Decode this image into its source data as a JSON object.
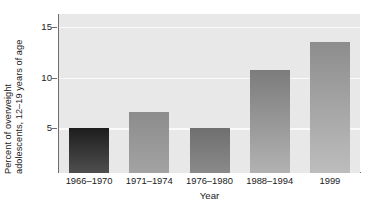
{
  "chart_data": {
    "type": "bar",
    "title": "",
    "subtitle": "",
    "xlabel": "Year",
    "ylabel_line1": "Percent of overweight",
    "ylabel_line2": "adolescents, 12–19 years of age",
    "ylabel": "Percent of overweight adolescents, 12–19 years of age",
    "categories": [
      "1966–1970",
      "1971–1974",
      "1976–1980",
      "1988–1994",
      "1999"
    ],
    "values": [
      5.0,
      6.6,
      5.0,
      10.8,
      13.5
    ],
    "ylim": [
      0.6,
      16.3
    ],
    "ytick_labels": [
      "5",
      "10",
      "15"
    ],
    "ytick_values": [
      5,
      10,
      15
    ],
    "grid": "horizontal-white-gridlines",
    "legend": "none",
    "legend_position": "none",
    "bar_fills": [
      {
        "top": "#1d1d1d",
        "bottom": "#4f4f4f"
      },
      {
        "top": "#8c8c8c",
        "bottom": "#a3a3a3"
      },
      {
        "top": "#6f6f6f",
        "bottom": "#8a8a8a"
      },
      {
        "top": "#7c7c7c",
        "bottom": "#b2b2b2"
      },
      {
        "top": "#8d8d8d",
        "bottom": "#bdbdbd"
      }
    ],
    "plot_background": "#e8e8e8",
    "gridline_color": "#fafafa",
    "axis_color": "#6e6e6e",
    "text_color": "#1a1a1a",
    "page_background": "#ffffff"
  }
}
